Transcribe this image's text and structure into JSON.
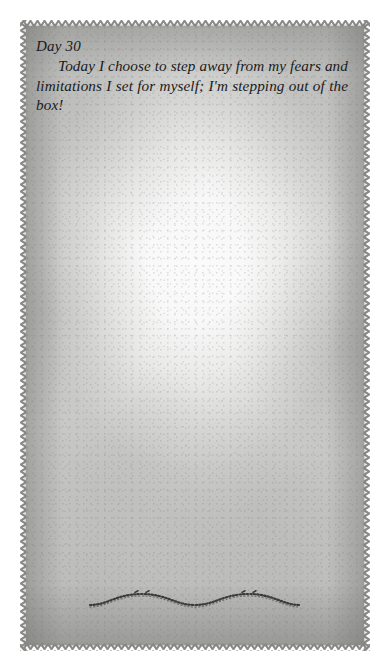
{
  "page": {
    "background_color": "#ffffff",
    "width": 389,
    "height": 670
  },
  "journal_card": {
    "name": "journal-page-card",
    "paper_color": "#c9c9c7",
    "border_color": "#8e8e8c",
    "border_style": "zigzag-deckled-edge",
    "text_color": "#1a1a1a"
  },
  "entry": {
    "day_label": "Day 30",
    "body_text": "Today I choose to step away from my fears and limitations I set for myself; I'm stepping out of the box!"
  },
  "ornament": {
    "name": "wavy-flourish",
    "description": "decorative sinusoidal calligraphic flourish",
    "color": "#2b2b2b"
  }
}
